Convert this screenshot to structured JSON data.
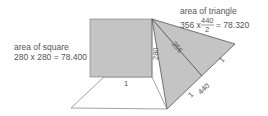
{
  "square_label": {
    "title": "area of square",
    "formula": "280 x 280 = 78.400"
  },
  "triangle_label": {
    "title": "area of triangle",
    "formula_prefix": "356 x",
    "fraction_numerator": "440",
    "fraction_denominator": "2",
    "formula_suffix": "= 78.320"
  },
  "edge_labels": {
    "square_bottom": "1",
    "square_side": "280",
    "triangle_height": "356",
    "hypotenuse": "440",
    "hyp_upper_segment": "1",
    "hyp_lower_segment": "1"
  },
  "colors": {
    "fill": "#c4c4c4",
    "stroke": "#555555",
    "text": "#555555"
  }
}
